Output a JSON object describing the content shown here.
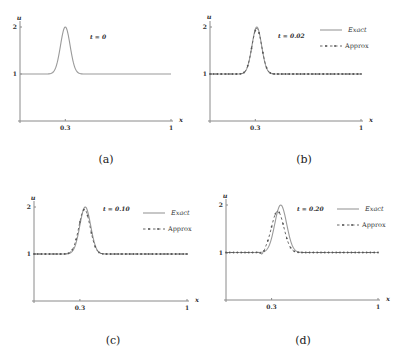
{
  "chart_data": [
    {
      "panel": "a",
      "type": "line",
      "caption": "(a)",
      "time_label": "t = 0",
      "xlabel": "x",
      "ylabel": "u",
      "xticks": [
        "0.3",
        "1"
      ],
      "yticks": [
        "1",
        "2"
      ],
      "xlim": [
        0,
        1
      ],
      "ylim": [
        0,
        2
      ],
      "legend": [],
      "series": [
        {
          "name": "Exact",
          "center": 0.3,
          "amplitude": 1.0,
          "width": 0.045,
          "baseline": 1.0
        }
      ]
    },
    {
      "panel": "b",
      "type": "line",
      "caption": "(b)",
      "time_label": "t = 0.02",
      "xlabel": "x",
      "ylabel": "u",
      "xticks": [
        "0.3",
        "1"
      ],
      "yticks": [
        "1",
        "2"
      ],
      "xlim": [
        0,
        1
      ],
      "ylim": [
        0,
        2
      ],
      "legend": [
        "Exact",
        "Approx"
      ],
      "series": [
        {
          "name": "Exact",
          "center": 0.31,
          "amplitude": 1.0,
          "width": 0.045,
          "baseline": 1.0
        },
        {
          "name": "Approx",
          "center": 0.31,
          "amplitude": 0.97,
          "width": 0.046,
          "baseline": 1.0
        }
      ]
    },
    {
      "panel": "c",
      "type": "line",
      "caption": "(c)",
      "time_label": "t = 0.10",
      "xlabel": "x",
      "ylabel": "u",
      "xticks": [
        "0.3",
        "1"
      ],
      "yticks": [
        "1",
        "2"
      ],
      "xlim": [
        0,
        1
      ],
      "ylim": [
        0,
        2
      ],
      "legend": [
        "Exact",
        "Approx"
      ],
      "series": [
        {
          "name": "Exact",
          "center": 0.335,
          "amplitude": 1.0,
          "width": 0.05,
          "baseline": 1.0
        },
        {
          "name": "Approx",
          "center": 0.33,
          "amplitude": 0.95,
          "width": 0.052,
          "baseline": 1.0
        }
      ]
    },
    {
      "panel": "d",
      "type": "line",
      "caption": "(d)",
      "time_label": "t = 0.20",
      "xlabel": "x",
      "ylabel": "u",
      "xticks": [
        "0.3",
        "1"
      ],
      "yticks": [
        "1",
        "2"
      ],
      "xlim": [
        0,
        1
      ],
      "ylim": [
        0,
        2
      ],
      "legend": [
        "Exact",
        "Approx"
      ],
      "series": [
        {
          "name": "Exact",
          "center": 0.36,
          "amplitude": 1.0,
          "width": 0.055,
          "baseline": 1.0
        },
        {
          "name": "Approx",
          "center": 0.34,
          "amplitude": 0.87,
          "width": 0.058,
          "baseline": 1.0,
          "undershoot": {
            "x": 0.24,
            "value": 0.93
          }
        }
      ]
    }
  ],
  "panels": [
    {
      "id": "a",
      "x0": 20,
      "x1": 171,
      "y0": 121,
      "y1": 74,
      "y2": 27,
      "ylabel_y": 18,
      "legend": null,
      "tlabel": {
        "x": 90,
        "y": 39
      },
      "caption": {
        "x": 106,
        "y": 163
      }
    },
    {
      "id": "b",
      "x0": 210,
      "x1": 361,
      "y0": 121,
      "y1": 74,
      "y2": 27,
      "ylabel_y": 17,
      "legend": {
        "x": 320,
        "y": 30
      },
      "tlabel": {
        "x": 278,
        "y": 38
      },
      "caption": {
        "x": 304,
        "y": 163
      }
    },
    {
      "id": "c",
      "x0": 34,
      "x1": 187,
      "y0": 301,
      "y1": 254,
      "y2": 207,
      "ylabel_y": 198,
      "legend": {
        "x": 143,
        "y": 213
      },
      "tlabel": {
        "x": 103,
        "y": 211
      },
      "caption": {
        "x": 113,
        "y": 344
      }
    },
    {
      "id": "d",
      "x0": 226,
      "x1": 378,
      "y0": 300,
      "y1": 253,
      "y2": 205,
      "ylabel_y": 196,
      "legend": {
        "x": 337,
        "y": 209
      },
      "tlabel": {
        "x": 297,
        "y": 211
      },
      "caption": {
        "x": 303,
        "y": 344
      }
    }
  ]
}
